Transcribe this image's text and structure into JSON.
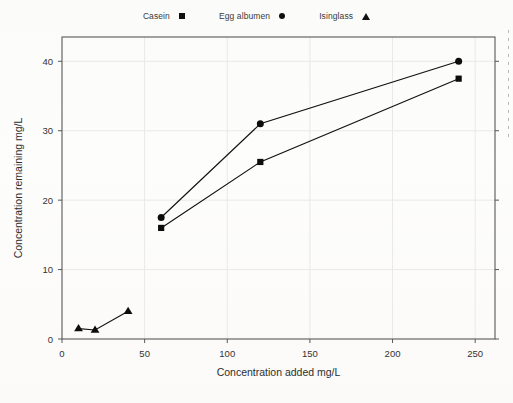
{
  "chart_data": {
    "type": "line",
    "title": "",
    "subtitle": "",
    "xlabel": "Concentration added mg/L",
    "ylabel": "Concentration remaining mg/L",
    "xlim": [
      0,
      262
    ],
    "ylim": [
      0,
      43.5
    ],
    "xticks": [
      0,
      50,
      100,
      150,
      200,
      250
    ],
    "yticks": [
      0,
      10,
      20,
      30,
      40
    ],
    "xtick_labels": [
      "0",
      "50",
      "100",
      "150",
      "200",
      "250"
    ],
    "ytick_labels": [
      "0",
      "10",
      "20",
      "30",
      "40"
    ],
    "grid": true,
    "grid_color": "#e9e9e6",
    "legend_position": "top-center",
    "series": [
      {
        "name": "Casein",
        "marker": "square",
        "color": "#0d0d0d",
        "x": [
          60,
          120,
          240
        ],
        "y": [
          16.0,
          25.5,
          37.5
        ]
      },
      {
        "name": "Egg albumen",
        "marker": "circle",
        "color": "#0d0d0d",
        "x": [
          60,
          120,
          240
        ],
        "y": [
          17.5,
          31.0,
          40.0
        ]
      },
      {
        "name": "Isinglass",
        "marker": "triangle",
        "color": "#0d0d0d",
        "x": [
          10,
          20,
          40
        ],
        "y": [
          1.5,
          1.3,
          4.0
        ]
      }
    ]
  },
  "legend": {
    "entries": [
      {
        "label": "Casein",
        "marker": "square"
      },
      {
        "label": "Egg albumen",
        "marker": "circle"
      },
      {
        "label": "Isinglass",
        "marker": "triangle"
      }
    ]
  },
  "axes": {
    "x_title": "Concentration added mg/L",
    "y_title": "Concentration remaining mg/L"
  }
}
